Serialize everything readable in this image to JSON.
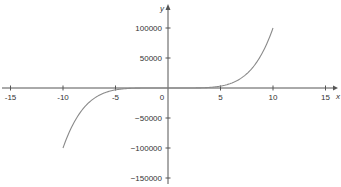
{
  "chart_data": {
    "type": "line",
    "title": "",
    "xlabel": "x",
    "ylabel": "y",
    "xlim": [
      -15,
      15
    ],
    "ylim": [
      -150000,
      100000
    ],
    "grid": false,
    "legend": null,
    "x_ticks": [
      -15,
      -10,
      -5,
      0,
      5,
      10,
      15
    ],
    "x_tick_labels": [
      "-15",
      "-10",
      "-5",
      "0",
      "5",
      "10",
      "15"
    ],
    "y_ticks": [
      100000,
      50000,
      -50000,
      -100000,
      -150000
    ],
    "y_tick_labels": [
      "100000",
      "50000",
      "-50000",
      "-100000",
      "-150000"
    ],
    "series": [
      {
        "name": "y = x^5",
        "x": [
          -10,
          -9,
          -8,
          -7,
          -6,
          -5,
          -4,
          -3,
          -2,
          -1,
          0,
          1,
          2,
          3,
          4,
          5,
          6,
          7,
          8,
          9,
          10
        ],
        "values": [
          -100000,
          -59049,
          -32768,
          -16807,
          -7776,
          -3125,
          -1024,
          -243,
          -32,
          -1,
          0,
          1,
          32,
          243,
          1024,
          3125,
          7776,
          16807,
          32768,
          59049,
          100000
        ],
        "color": "#8a8a8a"
      }
    ],
    "axis_color": "#555555"
  }
}
